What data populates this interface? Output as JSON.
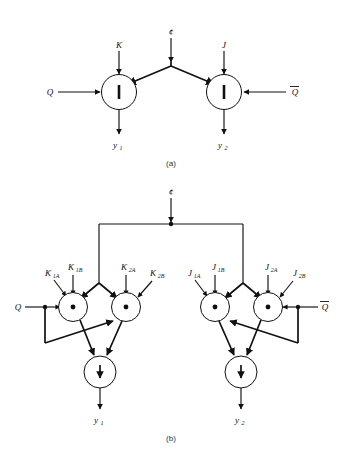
{
  "figure": {
    "captions": {
      "a": "(a)",
      "b": "(b)"
    }
  },
  "symbols": {
    "clock": "¢",
    "nand_bar": "|",
    "and_dot": "•",
    "nor_arrow": "↓",
    "overbar": "̅"
  },
  "diagram_a": {
    "caption": "(a)",
    "gates": [
      {
        "id": "gate-a-left",
        "symbol": "|",
        "type": "nand"
      },
      {
        "id": "gate-a-right",
        "symbol": "|",
        "type": "nand"
      }
    ],
    "inputs": [
      {
        "name": "clock",
        "label": "¢"
      },
      {
        "name": "k-input",
        "label": "K"
      },
      {
        "name": "j-input",
        "label": "J"
      },
      {
        "name": "q-input",
        "label": "Q"
      },
      {
        "name": "qbar-input",
        "label": "Q",
        "overbar": true
      }
    ],
    "outputs": [
      {
        "name": "y1-output",
        "label": "y",
        "sub": "1"
      },
      {
        "name": "y2-output",
        "label": "y",
        "sub": "2"
      }
    ]
  },
  "diagram_b": {
    "caption": "(b)",
    "clock": {
      "label": "¢"
    },
    "and_gates": [
      {
        "id": "and-k1",
        "symbol": "•"
      },
      {
        "id": "and-k2",
        "symbol": "•"
      },
      {
        "id": "and-j1",
        "symbol": "•"
      },
      {
        "id": "and-j2",
        "symbol": "•"
      }
    ],
    "nor_gates": [
      {
        "id": "nor-left",
        "symbol": "↓"
      },
      {
        "id": "nor-right",
        "symbol": "↓"
      }
    ],
    "k_inputs": [
      {
        "label": "K",
        "sub": "1A"
      },
      {
        "label": "K",
        "sub": "1B"
      },
      {
        "label": "K",
        "sub": "2A"
      },
      {
        "label": "K",
        "sub": "2B"
      }
    ],
    "j_inputs": [
      {
        "label": "J",
        "sub": "1A"
      },
      {
        "label": "J",
        "sub": "1B"
      },
      {
        "label": "J",
        "sub": "2A"
      },
      {
        "label": "J",
        "sub": "2B"
      }
    ],
    "feedback_inputs": [
      {
        "name": "q-input",
        "label": "Q",
        "overbar": false
      },
      {
        "name": "qbar-input",
        "label": "Q",
        "overbar": true
      }
    ],
    "outputs": [
      {
        "name": "y1-output",
        "label": "y",
        "sub": "1"
      },
      {
        "name": "y2-output",
        "label": "y",
        "sub": "2"
      }
    ]
  },
  "colors": {
    "ink": "#111111",
    "background": "#ffffff",
    "caption": "#333333"
  }
}
